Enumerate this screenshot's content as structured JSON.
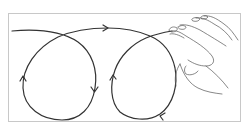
{
  "figure": {
    "caption": "",
    "colors": {
      "stroke": "#333333",
      "hand_stroke": "#555555",
      "frame": "#c8c8c8",
      "background": "#ffffff"
    },
    "elements": {
      "path": "continuous curve forming two clockwise/counter loops",
      "arrows": [
        "top-right",
        "left-loop-right-side-down",
        "left-loop-left-side-up",
        "right-loop-left-side-up",
        "right-loop-bottom-left"
      ],
      "hand": "right hand with fingertips at end of path"
    }
  }
}
